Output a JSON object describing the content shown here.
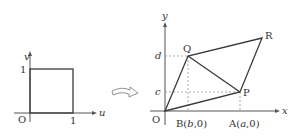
{
  "left_figure": {
    "axis_x_label": "u",
    "axis_y_label": "v",
    "origin_label": "O",
    "tick_x_label": "1",
    "tick_y_label": "1",
    "shape": "unit square"
  },
  "transform_arrow": {
    "icon": "curved-hollow-arrow-icon"
  },
  "right_figure": {
    "axis_x_label": "x",
    "axis_y_label": "y",
    "origin_label": "O",
    "point_p_label": "P",
    "point_q_label": "Q",
    "point_r_label": "R",
    "tick_d_label": "d",
    "tick_c_label": "c",
    "point_b": {
      "prefix": "B(",
      "var": "b",
      "suffix": ",0)"
    },
    "point_a": {
      "prefix": "A(",
      "var": "a",
      "suffix": ",0)"
    },
    "shape": "parallelogram OPRQ with diagonal QP"
  },
  "colors": {
    "line": "#3a3a3a",
    "dashed": "#888888",
    "text": "#333333",
    "background": "#ffffff"
  }
}
